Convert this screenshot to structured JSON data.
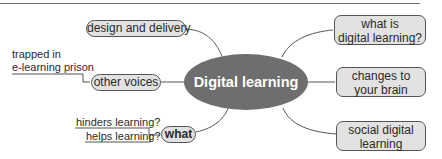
{
  "diagram": {
    "type": "mind-map",
    "center": {
      "label": "Digital learning"
    },
    "left_branches": [
      {
        "label": "design and delivery",
        "children": []
      },
      {
        "label": "other voices",
        "children": [
          {
            "label": "trapped in\ne-learning prison"
          }
        ]
      },
      {
        "label": "what",
        "children": [
          {
            "label": "hinders learning?"
          },
          {
            "label": "helps learning?"
          }
        ]
      }
    ],
    "right_branches": [
      {
        "label": "what is digital learning?",
        "line1": "what is",
        "line2": "digital learning?"
      },
      {
        "label": "changes to your brain",
        "line1": "changes to",
        "line2": "your brain"
      },
      {
        "label": "social digital learning",
        "line1": "social digital",
        "line2": "learning"
      }
    ],
    "leaves": {
      "trapped_line1": "trapped in",
      "trapped_line2": "e-learning prison"
    },
    "colors": {
      "node_fill": "#e2e2e2",
      "center_fill": "#6e6e6e",
      "line": "#555555"
    }
  }
}
